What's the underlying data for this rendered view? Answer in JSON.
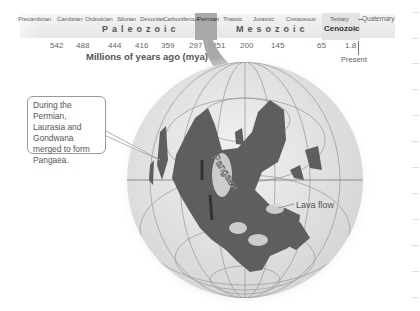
{
  "timeline": {
    "periods": [
      {
        "name": "Precambrian",
        "x": 18
      },
      {
        "name": "Cambrian",
        "x": 57
      },
      {
        "name": "Ordovician",
        "x": 85
      },
      {
        "name": "Silurian",
        "x": 117
      },
      {
        "name": "Devonian",
        "x": 140
      },
      {
        "name": "Carboniferous",
        "x": 163
      },
      {
        "name": "Permian",
        "x": 196
      },
      {
        "name": "Triassic",
        "x": 223
      },
      {
        "name": "Jurassic",
        "x": 252
      },
      {
        "name": "Cretaceous",
        "x": 285
      },
      {
        "name": "Tertiary",
        "x": 329
      }
    ],
    "eras": [
      {
        "name": "Paleozoic",
        "x": 102
      },
      {
        "name": "Mesozoic",
        "x": 236
      },
      {
        "name": "Cenozoic",
        "x": 324
      }
    ],
    "ticks": [
      {
        "value": "542",
        "x": 50
      },
      {
        "value": "488",
        "x": 76
      },
      {
        "value": "444",
        "x": 108
      },
      {
        "value": "416",
        "x": 135
      },
      {
        "value": "359",
        "x": 161
      },
      {
        "value": "297",
        "x": 189
      },
      {
        "value": "251",
        "x": 212
      },
      {
        "value": "200",
        "x": 240
      },
      {
        "value": "145",
        "x": 271
      },
      {
        "value": "65",
        "x": 317
      },
      {
        "value": "1.8",
        "x": 345
      }
    ],
    "quaternary_label": "Quaternary",
    "present_label": "Present",
    "axis_label": "Millions of years ago (mya)",
    "highlighted_period": "Permian"
  },
  "globe": {
    "callout_text": "During the Permian, Laurasia and Gondwana merged to form Pangaea.",
    "supercontinent_label": "Pangaea",
    "lava_label": "Lava flow"
  },
  "colors": {
    "land": "#5e5e5e",
    "ocean": "#e2e2e2",
    "highlight": "#a9a9a9",
    "grid": "#a0a0a0"
  }
}
